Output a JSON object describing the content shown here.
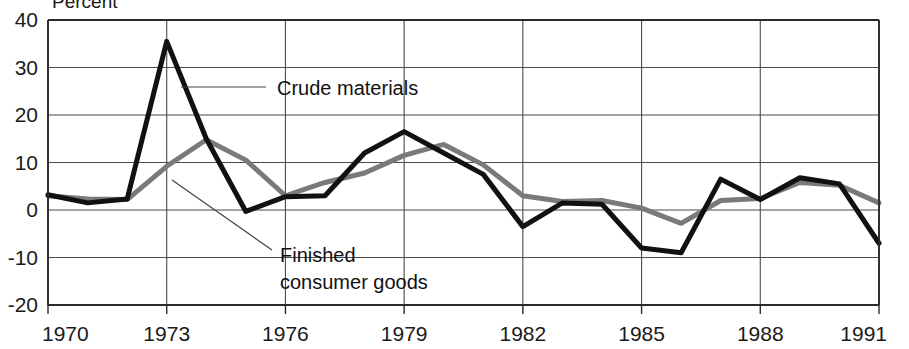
{
  "chart_data": {
    "type": "line",
    "title": "",
    "axis_label_top": "Percent",
    "xlabel": "",
    "ylabel": "Percent",
    "grid": true,
    "legend_position": "inline-annotations",
    "xlim": [
      1970,
      1991
    ],
    "ylim": [
      -20,
      40
    ],
    "ytick_labels": [
      "40",
      "30",
      "20",
      "10",
      "0",
      "-10",
      "-20"
    ],
    "yticks": [
      40,
      30,
      20,
      10,
      0,
      -10,
      -20
    ],
    "xtick_labels": [
      "1970",
      "1973",
      "1976",
      "1979",
      "1982",
      "1985",
      "1988",
      "1991"
    ],
    "xticks": [
      1970,
      1973,
      1976,
      1979,
      1982,
      1985,
      1988,
      1991
    ],
    "x": [
      1970,
      1971,
      1972,
      1973,
      1974,
      1975,
      1976,
      1977,
      1978,
      1979,
      1980,
      1981,
      1982,
      1983,
      1984,
      1985,
      1986,
      1987,
      1988,
      1989,
      1990,
      1991
    ],
    "series": [
      {
        "name": "Crude materials",
        "color": "#111111",
        "width": 5,
        "values": [
          3.2,
          1.5,
          2.3,
          35.5,
          15.0,
          -0.3,
          2.8,
          3.0,
          12.0,
          16.5,
          12.0,
          7.5,
          -3.5,
          1.5,
          1.2,
          -8.0,
          -9.0,
          6.5,
          2.2,
          6.8,
          5.5,
          -7.0
        ]
      },
      {
        "name": "Finished consumer goods",
        "color": "#7a7a7a",
        "width": 5,
        "values": [
          3.0,
          2.3,
          2.2,
          9.2,
          14.8,
          10.5,
          3.0,
          5.8,
          7.8,
          11.5,
          13.8,
          9.5,
          3.0,
          1.8,
          2.0,
          0.4,
          -2.8,
          2.0,
          2.4,
          5.8,
          5.2,
          1.5
        ]
      }
    ],
    "annotations": [
      {
        "label": "Crude materials",
        "target_x": 1973,
        "target_y": 25
      },
      {
        "label": "Finished consumer goods",
        "line1": "Finished",
        "line2": "consumer goods",
        "target_x": 1973,
        "target_y": 9
      }
    ]
  }
}
